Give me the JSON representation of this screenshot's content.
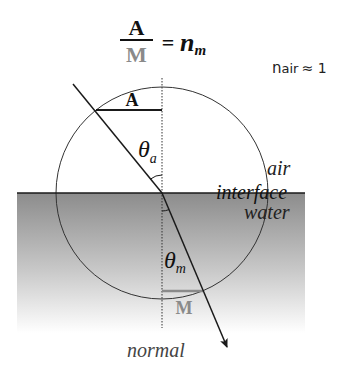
{
  "equation": {
    "numerator": "A",
    "denominator": "M",
    "equals": "=",
    "rhs_main": "n",
    "rhs_sub": "m"
  },
  "note": {
    "text_main": "n",
    "text_sub": "air",
    "approx": "≈ 1"
  },
  "labels": {
    "segment_air": "A",
    "segment_water": "M",
    "theta": "θ",
    "theta_air_sub": "a",
    "theta_water_sub": "m",
    "medium_top": "air",
    "boundary": "interface",
    "medium_bottom": "water",
    "normal": "normal"
  },
  "colors": {
    "line": "#1a1a1a",
    "water_top": "#8c8c8c",
    "water_bottom": "#ffffff",
    "segment_water": "#8a8a8a",
    "text": "#111111",
    "note": "#222222",
    "normal_label": "#444444"
  }
}
